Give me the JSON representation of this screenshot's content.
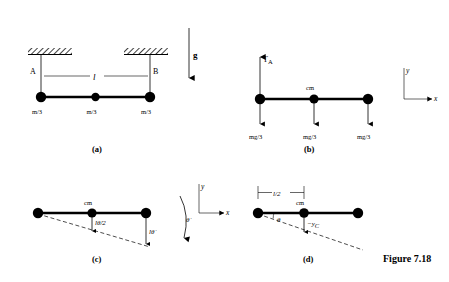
{
  "figure": {
    "caption": "Figure 7.18"
  },
  "panels": {
    "a": {
      "label": "(a)",
      "point_a": "A",
      "point_b": "B",
      "length_label": "l",
      "gravity_label": "g",
      "mass_labels": [
        "m/3",
        "m/3",
        "m/3"
      ]
    },
    "b": {
      "label": "(b)",
      "tension_label": "T",
      "tension_sub": "A",
      "cm_label": "cm",
      "weight_labels": [
        "mg/3",
        "mg/3",
        "mg/3"
      ],
      "axis_x": "x",
      "axis_y": "y"
    },
    "c": {
      "label": "(c)",
      "cm_label": "cm",
      "vel_cm_label": "lθ̇/2",
      "vel_end_label": "lθ̇",
      "omega_label": "θ̇",
      "axis_x": "x",
      "axis_y": "y"
    },
    "d": {
      "label": "(d)",
      "half_length_label": "l/2",
      "cm_label": "cm",
      "angle_label": "θ",
      "displacement_label": "−y",
      "displacement_sub": "C"
    }
  }
}
